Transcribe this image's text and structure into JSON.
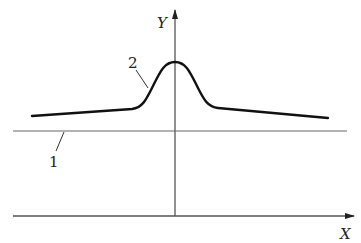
{
  "diagram": {
    "axes": {
      "x_label": "X",
      "y_label": "Y"
    },
    "labels": [
      {
        "id": "1",
        "text": "1",
        "refers_to": "horizontal reference line"
      },
      {
        "id": "2",
        "text": "2",
        "refers_to": "bell-shaped curve"
      }
    ],
    "colors": {
      "axis": "#555555",
      "curve": "#111111",
      "line": "#666666",
      "text": "#222222"
    }
  }
}
